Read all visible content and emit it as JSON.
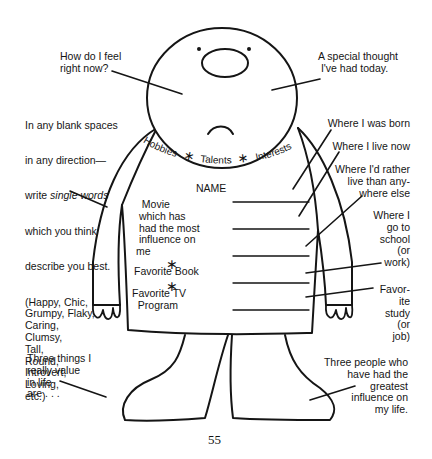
{
  "worksheet": {
    "head_prompts": {
      "left": "How do I feel\nright now?",
      "right": "A special thought\n I've had today."
    },
    "collar_text": {
      "hobbies": "Hobbies",
      "talents": "Talents",
      "interests": "Interests",
      "separator": "∗"
    },
    "instructions": {
      "line1": "In any blank spaces",
      "line2": "in any direction—",
      "line3_prefix": "write ",
      "line3_italic": "single words",
      "line4": "which you think",
      "line5": "describe you best.",
      "examples": "(Happy, Chic,\nGrumpy, Flaky,\nCaring,\nClumsy,\nTall,\nRound,\nIntrovert,\nLoving,\netc.)"
    },
    "shirt": {
      "name_label": "NAME",
      "movie": "  Movie\n which has\n had the most\n influence on\nme",
      "separator": "∗",
      "book": "Favorite Book",
      "tv": "Favorite TV\n  Program",
      "blank_lines": 5
    },
    "right_prompts": [
      "Where I was born",
      "Where I live now",
      "Where I'd rather\nlive than any-\nwhere else",
      "Where I\ngo to\nschool\n(or\nwork)",
      "Favor-\nite\nstudy\n(or\njob)"
    ],
    "feet_prompts": {
      "left": "Three things I\nreally value\nin life\nare . . .",
      "right": "Three people who\nhave had the\ngreatest\ninfluence on\nmy life."
    },
    "page_number": "55",
    "colors": {
      "ink": "#151515",
      "paper": "#ffffff"
    }
  }
}
